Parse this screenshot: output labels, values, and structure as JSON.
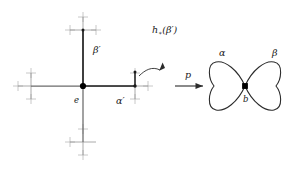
{
  "figure": {
    "background_color": "#ffffff",
    "stroke_color": "#8c8c8c",
    "bold_stroke_color": "#4d4d4d",
    "vertex_color": "#000000",
    "label_color": "#1a1a1a"
  },
  "left_graph": {
    "name": "cayley-graph",
    "center_vertex_label": "e",
    "edge_labels": {
      "vertical_up": "β",
      "vertical_up_prime": "′",
      "horizontal_right": "α",
      "horizontal_right_prime": "′"
    },
    "beta_prime_label": "β′",
    "alpha_prime_label": "α′",
    "lift_label_base": "h",
    "lift_label_subscript": "∗",
    "lift_label_arg": "(β′)",
    "lift_label_full": "h∗(β′)"
  },
  "arrow": {
    "name": "map-arrow",
    "label": "p"
  },
  "right_graph": {
    "name": "wedge-of-two-circles",
    "loop_left_label": "α",
    "loop_right_label": "β",
    "basepoint_label": "b"
  }
}
